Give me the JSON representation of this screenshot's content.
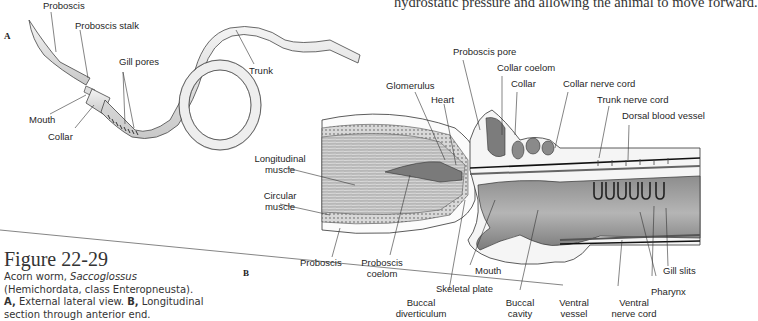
{
  "body_text": {
    "top_line": "hydrostatic pressure and allowing the animal to move forward."
  },
  "figure": {
    "title": "Figure 22-29",
    "caption": {
      "part1": "Acorn worm, ",
      "genus": "Saccoglossus",
      "part2": " (Hemichordata, class Enteropneusta). ",
      "a_label": "A,",
      "a_text": " External lateral view. ",
      "b_label": "B,",
      "b_text": " Longitudinal section through anterior end."
    }
  },
  "panel_a": {
    "letter": "A",
    "labels": {
      "proboscis": "Proboscis",
      "proboscis_stalk": "Proboscis stalk",
      "gill_pores": "Gill pores",
      "trunk": "Trunk",
      "mouth": "Mouth",
      "collar": "Collar"
    }
  },
  "panel_b": {
    "letter": "B",
    "labels": {
      "proboscis_pore": "Proboscis pore",
      "collar_coelom": "Collar coelom",
      "collar": "Collar",
      "collar_nerve_cord": "Collar nerve cord",
      "trunk_nerve_cord": "Trunk nerve cord",
      "dorsal_blood_vessel": "Dorsal blood vessel",
      "glomerulus": "Glomerulus",
      "heart": "Heart",
      "longitudinal_muscle_1": "Longitudinal",
      "longitudinal_muscle_2": "muscle",
      "circular_muscle_1": "Circular",
      "circular_muscle_2": "muscle",
      "proboscis": "Proboscis",
      "proboscis_coelom_1": "Proboscis",
      "proboscis_coelom_2": "coelom",
      "mouth": "Mouth",
      "skeletal_plate": "Skeletal plate",
      "buccal_diverticulum_1": "Buccal",
      "buccal_diverticulum_2": "diverticulum",
      "buccal_cavity_1": "Buccal",
      "buccal_cavity_2": "cavity",
      "ventral_vessel_1": "Ventral",
      "ventral_vessel_2": "vessel",
      "ventral_nerve_cord_1": "Ventral",
      "ventral_nerve_cord_2": "nerve cord",
      "gill_slits": "Gill slits",
      "pharynx": "Pharynx"
    }
  }
}
